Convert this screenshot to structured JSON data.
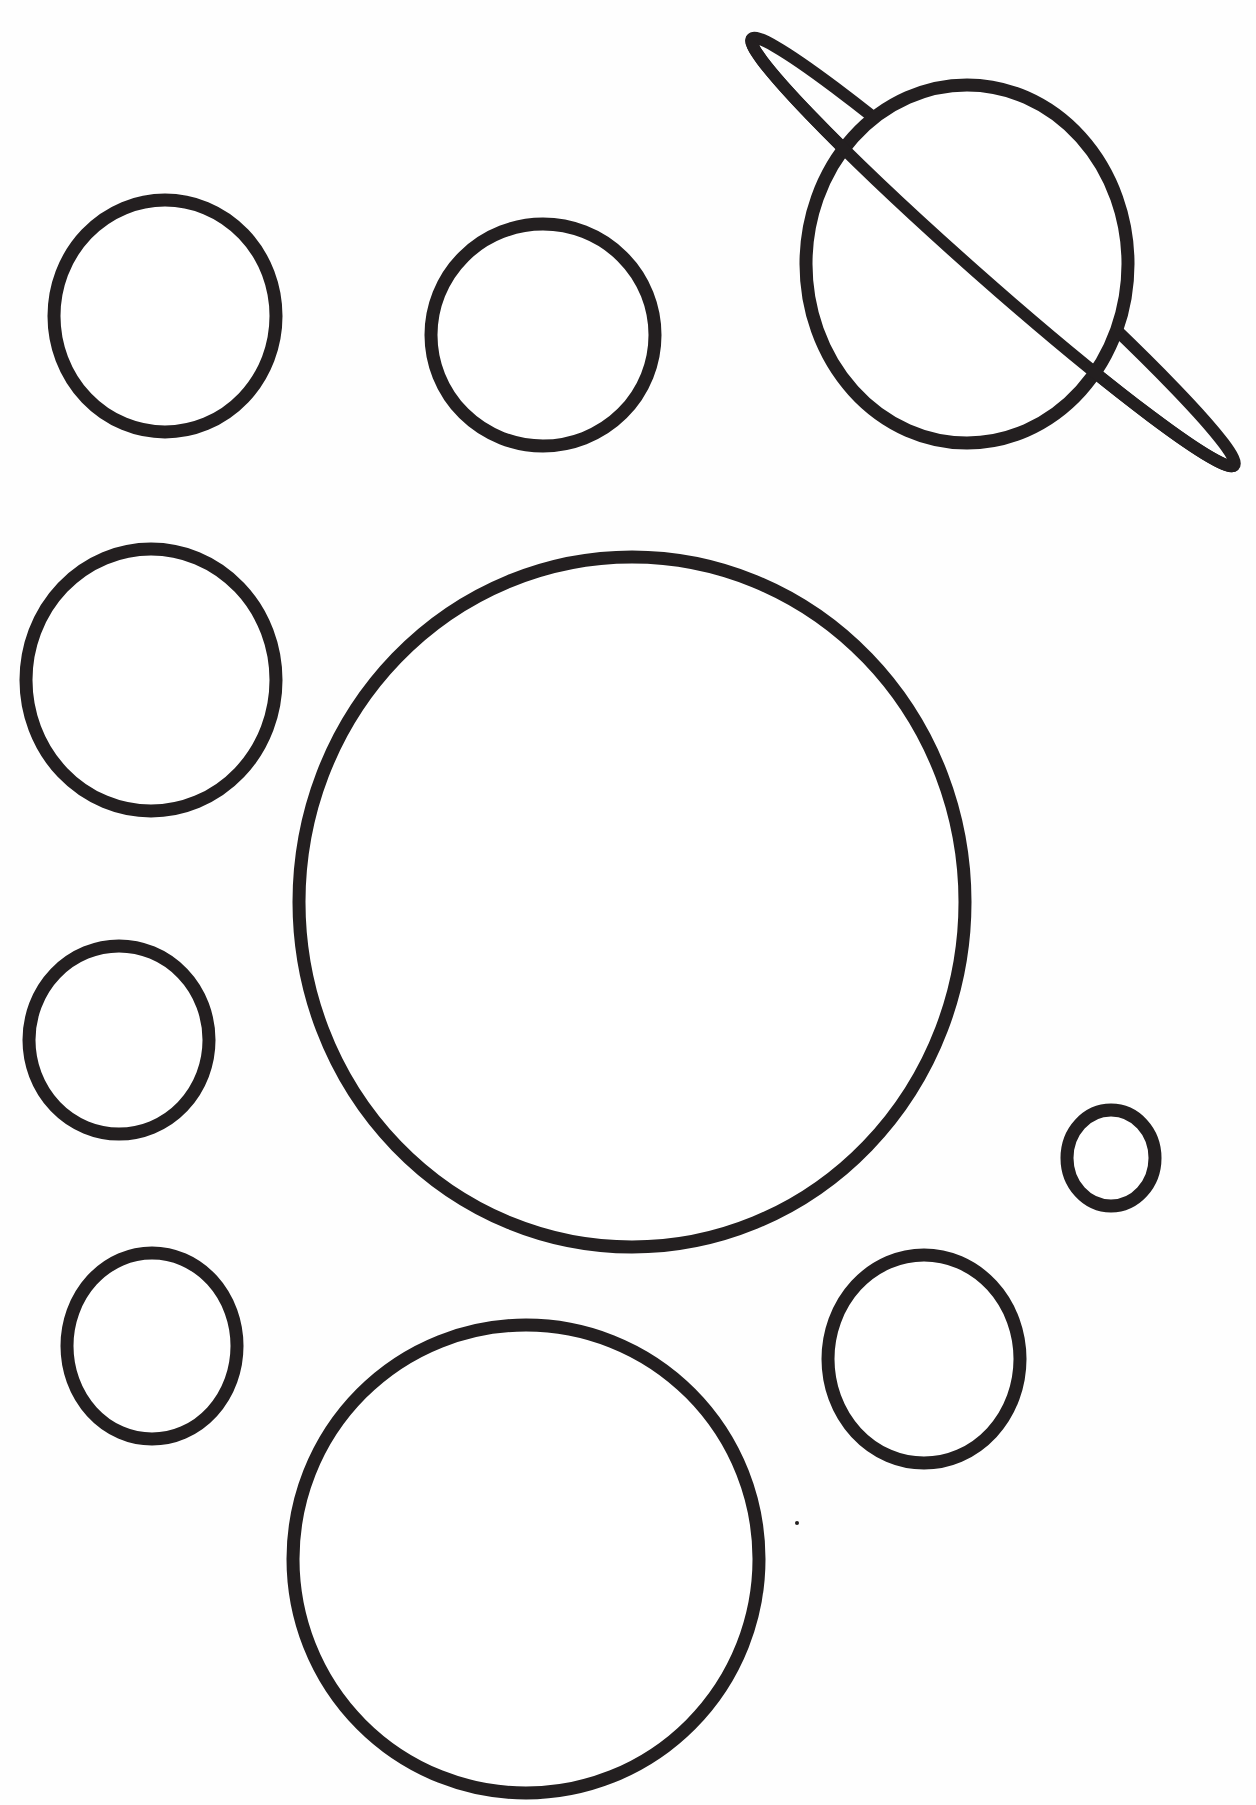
{
  "page": {
    "width": 1256,
    "height": 1805,
    "background": "#ffffff",
    "ink_color": "#231f20"
  },
  "planets": [
    {
      "name": "planet-top-left",
      "cx": 165,
      "cy": 316,
      "rx": 111,
      "ry": 116
    },
    {
      "name": "planet-top-middle",
      "cx": 543,
      "cy": 335,
      "rx": 112,
      "ry": 111
    },
    {
      "name": "planet-left-middle",
      "cx": 151,
      "cy": 680,
      "rx": 125,
      "ry": 131
    },
    {
      "name": "planet-large-center",
      "cx": 632,
      "cy": 902,
      "rx": 333,
      "ry": 345
    },
    {
      "name": "planet-left-lower",
      "cx": 119,
      "cy": 1040,
      "rx": 90,
      "ry": 94
    },
    {
      "name": "planet-tiny-right",
      "cx": 1111,
      "cy": 1158,
      "rx": 44,
      "ry": 48
    },
    {
      "name": "planet-bottom-left",
      "cx": 152,
      "cy": 1346,
      "rx": 85,
      "ry": 93
    },
    {
      "name": "planet-bottom-right",
      "cx": 924,
      "cy": 1359,
      "rx": 96,
      "ry": 104
    },
    {
      "name": "planet-bottom-center",
      "cx": 526,
      "cy": 1559,
      "rx": 233,
      "ry": 234
    }
  ],
  "ringed_planet": {
    "name": "ringed-planet-saturn",
    "body": {
      "cx": 967,
      "cy": 264,
      "rx": 161,
      "ry": 179
    },
    "ring": {
      "cx": 993,
      "cy": 252,
      "rx": 322,
      "ry": 26,
      "angle": 41.5
    }
  },
  "specks": [
    {
      "cx": 797,
      "cy": 1523,
      "r": 2
    }
  ]
}
